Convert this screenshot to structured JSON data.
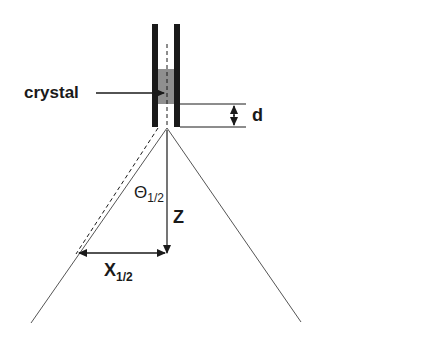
{
  "diagram": {
    "labels": {
      "crystal": "crystal",
      "thickness": "d",
      "theta": "Θ",
      "theta_sub": "1/2",
      "distance": "Z",
      "x": "X",
      "x_sub": "1/2"
    },
    "colors": {
      "line": "#1a1a1a",
      "crystal_fill": "#8f8f8f",
      "thin_line": "#555555"
    }
  }
}
